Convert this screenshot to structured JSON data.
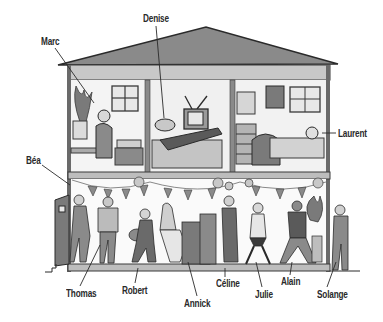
{
  "illustration": {
    "subject": "house cross-section with people",
    "upstairs_rooms": [
      {
        "name": "room-marc",
        "contents": [
          "plant",
          "window",
          "desk",
          "computer",
          "bed"
        ]
      },
      {
        "name": "room-denise",
        "contents": [
          "bed",
          "television"
        ]
      },
      {
        "name": "room-laurent",
        "contents": [
          "dresser",
          "mirror",
          "poster",
          "window",
          "bed"
        ]
      }
    ],
    "downstairs": {
      "scene": "party",
      "contents": [
        "bunting",
        "balloons",
        "piano",
        "plants",
        "guitar",
        "door"
      ]
    }
  },
  "labels": {
    "marc": "Marc",
    "denise": "Denise",
    "laurent": "Laurent",
    "bea": "Béa",
    "thomas": "Thomas",
    "robert": "Robert",
    "annick": "Annick",
    "celine": "Céline",
    "julie": "Julie",
    "alain": "Alain",
    "solange": "Solange"
  },
  "colors": {
    "roof": "#8a8a8a",
    "ceiling_band": "#c8c8c8",
    "wall_line": "#3a3a3a",
    "floor": "#bdbdbd",
    "room_bg": "#f4f4f4",
    "figure_dark": "#5a5a5a",
    "figure_mid": "#9a9a9a"
  }
}
